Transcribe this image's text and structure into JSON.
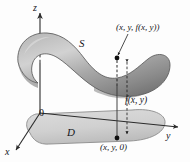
{
  "figure": {
    "axes": {
      "z_label": "z",
      "y_label": "y",
      "x_label": "x",
      "origin_label": "0"
    },
    "regions": {
      "surface_label": "S",
      "domain_label": "D"
    },
    "annotations": {
      "surface_point": "(x, y, f(x, y))",
      "height_label": "f(x, y)",
      "base_point": "(x, y, 0)"
    },
    "colors": {
      "surface_light": "#cfcfcf",
      "surface_mid": "#a9a9a9",
      "surface_dark": "#6e6e6e",
      "surface_stroke": "#4a4a4a",
      "domain_fill": "#d4d4d4",
      "domain_stroke": "#7a7a7a",
      "axis": "#2b2b2b",
      "text": "#15151a",
      "background": "#fdfdfd"
    }
  }
}
